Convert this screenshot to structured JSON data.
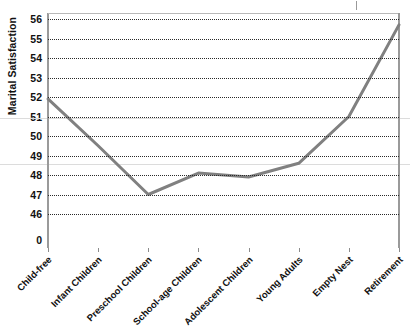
{
  "chart_data": {
    "type": "line",
    "title": "",
    "xlabel": "",
    "ylabel": "Marital Satisfaction",
    "categories": [
      "Child-free",
      "Infant Children",
      "Preschool Children",
      "School-age Children",
      "Adolescent Children",
      "Young Adults",
      "Empty Nest",
      "Retirement"
    ],
    "values": [
      51.9,
      49.5,
      47.0,
      48.1,
      47.9,
      48.6,
      51.0,
      55.7
    ],
    "series": [
      {
        "name": "Marital Satisfaction",
        "values": [
          51.9,
          49.5,
          47.0,
          48.1,
          47.9,
          48.6,
          51.0,
          55.7
        ],
        "color": "#808080"
      }
    ],
    "ytick_labels": [
      "56",
      "55",
      "54",
      "53",
      "52",
      "51",
      "50",
      "49",
      "48",
      "47",
      "46",
      "0"
    ],
    "ytick_values": [
      56,
      55,
      54,
      53,
      52,
      51,
      50,
      49,
      48,
      47,
      46,
      0
    ],
    "ylim": [
      46,
      56
    ],
    "grid": true,
    "grid_style": "dotted",
    "grid_color": "#2a2a2a",
    "legend": "none",
    "line_color": "#808080",
    "line_width": 3,
    "markers": "none",
    "axis_color": "#9a9a9a",
    "plot_border_color": "#b8b8b8",
    "background": "#ffffff"
  }
}
